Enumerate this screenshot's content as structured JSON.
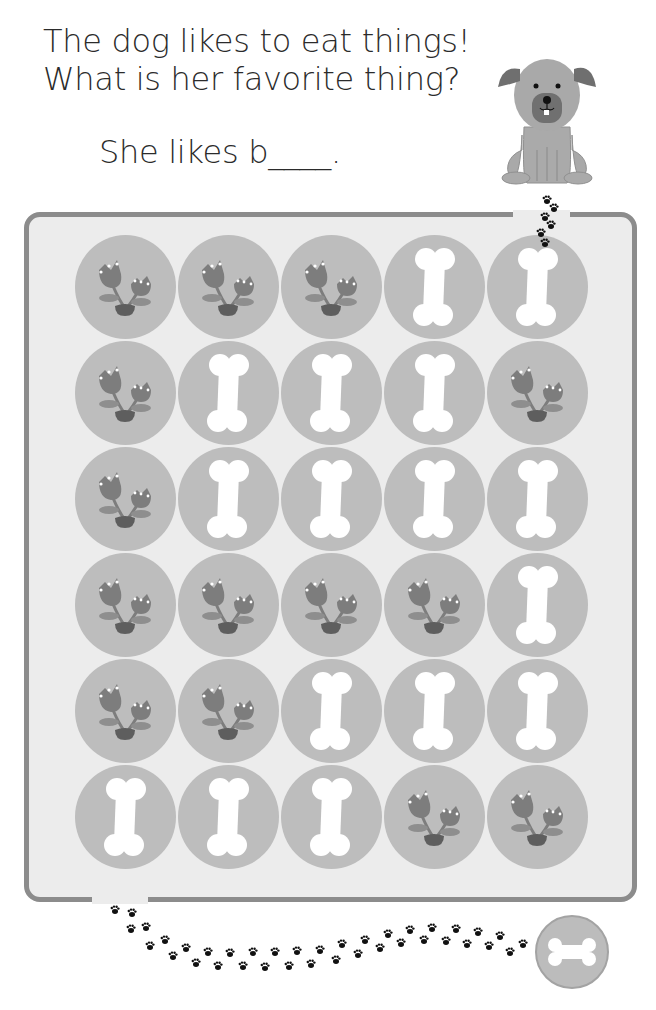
{
  "worksheet": {
    "question_line1": "The dog likes to eat things!",
    "question_line2": "What is her favorite thing?",
    "answer_prompt": "She likes b____.",
    "answer_value": ""
  },
  "maze": {
    "start": "dog",
    "goal": "bone-icon",
    "entrance": "top-right",
    "exit": "bottom-left",
    "legend": {
      "B": "bone-icon",
      "F": "flower-icon"
    },
    "grid": [
      [
        "F",
        "F",
        "F",
        "B",
        "B"
      ],
      [
        "F",
        "B",
        "B",
        "B",
        "F"
      ],
      [
        "F",
        "B",
        "B",
        "B",
        "B"
      ],
      [
        "F",
        "F",
        "F",
        "F",
        "B"
      ],
      [
        "F",
        "F",
        "B",
        "B",
        "B"
      ],
      [
        "B",
        "B",
        "B",
        "F",
        "F"
      ]
    ]
  },
  "colors": {
    "board_bg": "#ececec",
    "board_border": "#8c8c8c",
    "circle": "#bdbdbd",
    "flower": "#7d7d7d",
    "leaf": "#8e8e8e",
    "pot": "#5e5e5e",
    "bone": "#ffffff",
    "paw": "#111111",
    "dog_body": "#a9a9a9",
    "dog_ear": "#6f6f6f",
    "dog_muzzle": "#707070"
  }
}
